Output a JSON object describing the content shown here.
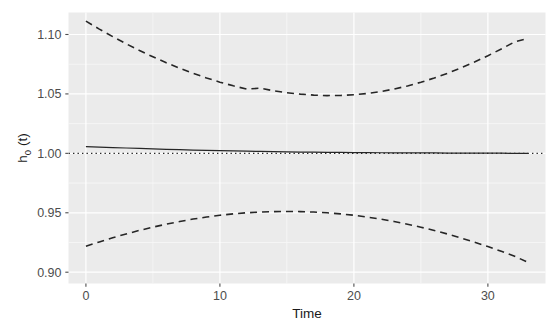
{
  "chart_data": {
    "type": "line",
    "title": "",
    "xlabel": "Time",
    "ylabel": "h0 (t)",
    "ylabel_base": "h",
    "ylabel_sub": "0",
    "ylabel_arg": " (t)",
    "xlim": [
      -1.3,
      34.3
    ],
    "ylim": [
      0.8905,
      1.1185
    ],
    "xticks": [
      0,
      10,
      20,
      30
    ],
    "xticklabels": [
      "0",
      "10",
      "20",
      "30"
    ],
    "yticks": [
      0.9,
      0.95,
      1.0,
      1.05,
      1.1
    ],
    "yticklabels": [
      "0.90",
      "0.95",
      "1.00",
      "1.05",
      "1.10"
    ],
    "grid": true,
    "grid_major_color": "#ffffff",
    "grid_minor_color": "#f7f7f7",
    "panel_background": "#ebebeb",
    "plot_background": "#ffffff",
    "legend": "none",
    "series": [
      {
        "name": "estimate",
        "style": "solid",
        "color": "#262626",
        "linewidth": 1.25,
        "x": [
          0,
          1,
          2,
          3,
          4,
          5,
          6,
          7,
          8,
          9,
          10,
          11,
          12,
          13,
          14,
          15,
          16,
          17,
          18,
          19,
          20,
          21,
          22,
          23,
          24,
          25,
          26,
          27,
          28,
          29,
          30,
          31,
          32,
          33
        ],
        "values": [
          1.0057,
          1.0053,
          1.0049,
          1.0045,
          1.0041,
          1.0037,
          1.0034,
          1.0031,
          1.0028,
          1.0025,
          1.0023,
          1.002,
          1.0018,
          1.0016,
          1.0014,
          1.0013,
          1.0011,
          1.001,
          1.0009,
          1.0008,
          1.0007,
          1.0006,
          1.0005,
          1.0004,
          1.0004,
          1.0003,
          1.0003,
          1.0002,
          1.0002,
          1.0001,
          1.0001,
          1.0001,
          1.0,
          1.0
        ]
      },
      {
        "name": "upper-confidence-band",
        "style": "dashed",
        "color": "#262626",
        "linewidth": 1.6,
        "x": [
          0,
          1,
          2,
          3,
          4,
          5,
          6,
          7,
          8,
          9,
          10,
          11,
          12,
          13,
          14,
          15,
          16,
          17,
          18,
          19,
          20,
          21,
          22,
          23,
          24,
          25,
          26,
          27,
          28,
          29,
          30,
          31,
          32,
          33
        ],
        "values": [
          1.1112,
          1.1045,
          1.0982,
          1.0922,
          1.0865,
          1.0812,
          1.0762,
          1.0716,
          1.0673,
          1.0634,
          1.0599,
          1.0568,
          1.0541,
          1.0548,
          1.0527,
          1.051,
          1.0498,
          1.049,
          1.0486,
          1.0487,
          1.0493,
          1.0504,
          1.052,
          1.0541,
          1.0567,
          1.0598,
          1.0634,
          1.0674,
          1.0719,
          1.0768,
          1.0821,
          1.0878,
          1.0938,
          1.0968
        ]
      },
      {
        "name": "lower-confidence-band",
        "style": "dashed",
        "color": "#262626",
        "linewidth": 1.6,
        "x": [
          0,
          1,
          2,
          3,
          4,
          5,
          6,
          7,
          8,
          9,
          10,
          11,
          12,
          13,
          14,
          15,
          16,
          17,
          18,
          19,
          20,
          21,
          22,
          23,
          24,
          25,
          26,
          27,
          28,
          29,
          30,
          31,
          32,
          33
        ],
        "values": [
          0.9219,
          0.9255,
          0.929,
          0.9322,
          0.9352,
          0.9379,
          0.9404,
          0.9427,
          0.9447,
          0.9464,
          0.9479,
          0.9491,
          0.95,
          0.9506,
          0.951,
          0.9511,
          0.951,
          0.9506,
          0.95,
          0.9491,
          0.9479,
          0.9464,
          0.9447,
          0.9427,
          0.9404,
          0.9379,
          0.9351,
          0.9321,
          0.9288,
          0.9253,
          0.9216,
          0.9176,
          0.9134,
          0.9082
        ]
      },
      {
        "name": "reference-line",
        "style": "dotted",
        "color": "#262626",
        "linewidth": 1.3,
        "x": [
          -1.3,
          34.3
        ],
        "values": [
          1.0,
          1.0
        ]
      }
    ]
  }
}
